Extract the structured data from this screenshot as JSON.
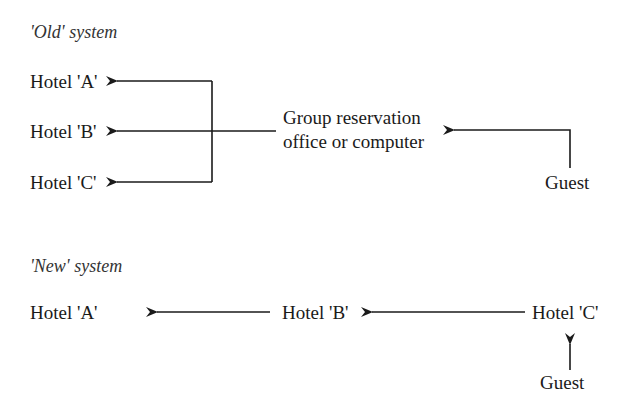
{
  "old_system": {
    "title": "'Old' system",
    "hotels": [
      "Hotel 'A'",
      "Hotel 'B'",
      "Hotel 'C'"
    ],
    "office_line1": "Group reservation",
    "office_line2": "office or computer",
    "guest": "Guest"
  },
  "new_system": {
    "title": "'New' system",
    "hotels": [
      "Hotel 'A'",
      "Hotel 'B'",
      "Hotel 'C'"
    ],
    "guest": "Guest"
  },
  "colors": {
    "line": "#1a1a1a",
    "background": "#ffffff"
  }
}
